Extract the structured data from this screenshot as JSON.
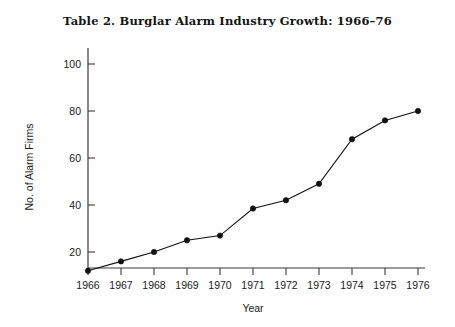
{
  "chart_data": {
    "type": "line",
    "title": "Table  2.  Burglar Alarm Industry Growth: 1966–76",
    "xlabel": "Year",
    "ylabel": "No. of Alarm Firms",
    "categories": [
      "1966",
      "1967",
      "1968",
      "1969",
      "1970",
      "1971",
      "1972",
      "1973",
      "1974",
      "1975",
      "1976"
    ],
    "x": [
      1966,
      1967,
      1968,
      1969,
      1970,
      1971,
      1972,
      1973,
      1974,
      1975,
      1976
    ],
    "values": [
      12,
      16,
      20,
      25,
      27,
      38.5,
      42,
      49,
      68,
      76,
      80
    ],
    "series": [
      {
        "name": "No. of Alarm Firms",
        "values": [
          12,
          16,
          20,
          25,
          27,
          38.5,
          42,
          49,
          68,
          76,
          80
        ]
      }
    ],
    "xlim": [
      1966,
      1976
    ],
    "ylim": [
      0,
      110
    ],
    "ytick_labels": [
      "20",
      "40",
      "60",
      "80",
      "100"
    ],
    "ytick_values": [
      20,
      40,
      60,
      80,
      100
    ],
    "xtick_labels": [
      "1966",
      "1967",
      "1968",
      "1969",
      "1970",
      "1971",
      "1972",
      "1973",
      "1974",
      "1975",
      "1976"
    ],
    "grid": false,
    "legend": false,
    "legend_position": "none",
    "marker": "filled-circle",
    "line_color": "#111111",
    "marker_color": "#111111",
    "axis_color": "#3a3a3a",
    "background_color": "#fefefe"
  }
}
